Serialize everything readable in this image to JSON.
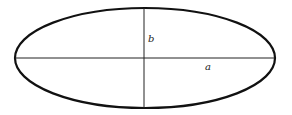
{
  "diagram": {
    "type": "ellipse-with-axes",
    "colors": {
      "stroke": "#111111",
      "background": "#ffffff",
      "label": "#222222"
    },
    "ellipse": {
      "cx": 145,
      "cy": 58,
      "rx": 130,
      "ry": 50
    },
    "labels": {
      "semi_minor": "b",
      "semi_major": "a"
    }
  }
}
